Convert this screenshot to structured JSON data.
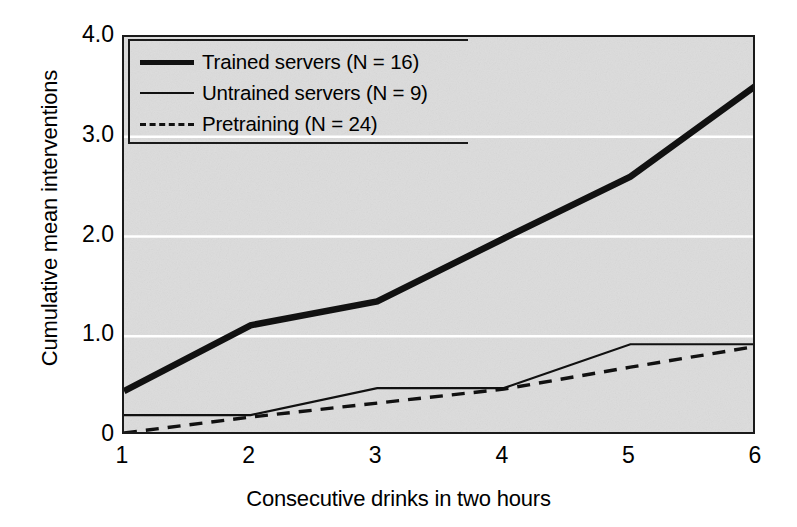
{
  "chart_data": {
    "type": "line",
    "title": "",
    "xlabel": "Consecutive drinks in two hours",
    "ylabel": "Cumulative mean interventions",
    "x": [
      1,
      2,
      3,
      4,
      5,
      6
    ],
    "xlim": [
      1,
      6
    ],
    "ylim": [
      0,
      4.0
    ],
    "xticks": [
      "1",
      "2",
      "3",
      "4",
      "5",
      "6"
    ],
    "yticks": [
      "0",
      "1.0",
      "2.0",
      "3.0",
      "4.0"
    ],
    "ytick_values": [
      0,
      1.0,
      2.0,
      3.0,
      4.0
    ],
    "grid": "horizontal-white-gridlines",
    "legend_position": "top-left",
    "series": [
      {
        "name": "Trained servers (N = 16)",
        "style": "thick-solid",
        "color": "#111111",
        "values": [
          0.45,
          1.11,
          1.35,
          1.98,
          2.6,
          3.52
        ]
      },
      {
        "name": "Untrained servers (N = 9)",
        "style": "thin-solid",
        "color": "#111111",
        "values": [
          0.21,
          0.21,
          0.48,
          0.48,
          0.92,
          0.92
        ]
      },
      {
        "name": "Pretraining (N = 24)",
        "style": "dashed",
        "color": "#111111",
        "values": [
          0.03,
          0.19,
          0.33,
          0.47,
          0.69,
          0.9
        ]
      }
    ]
  },
  "axes": {
    "y_title": "Cumulative mean interventions",
    "x_title": "Consecutive drinks in two hours",
    "y_tick_labels": [
      "4.0",
      "3.0",
      "2.0",
      "1.0",
      "0"
    ],
    "x_tick_labels": [
      "1",
      "2",
      "3",
      "4",
      "5",
      "6"
    ]
  },
  "legend": {
    "entries": [
      {
        "label": "Trained servers (N = 16)",
        "style": "thick-solid"
      },
      {
        "label": "Untrained servers (N = 9)",
        "style": "thin-solid"
      },
      {
        "label": "Pretraining (N = 24)",
        "style": "dashed"
      }
    ]
  },
  "colors": {
    "plot_background": "#dcdcdc",
    "axis": "#1a1a1a",
    "line": "#111111",
    "gridline": "#ffffff",
    "page_background": "#ffffff"
  }
}
